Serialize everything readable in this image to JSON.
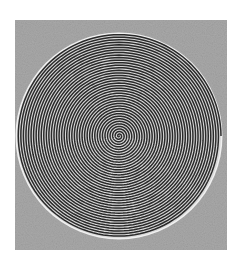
{
  "image": {
    "subject": "spiral-disc",
    "description": "Tightly wound concentric spiral of dark and light rings inside a circle on a mottled gray square background",
    "colors": {
      "background": "#ffffff",
      "frame": "#a9a9a9",
      "ring_dark": "#2a2a2a",
      "ring_light": "#d8d8d8",
      "rim": "#f0f0f0"
    },
    "spiral": {
      "center": [
        119,
        136
      ],
      "radius": 102,
      "turns": 40
    }
  }
}
